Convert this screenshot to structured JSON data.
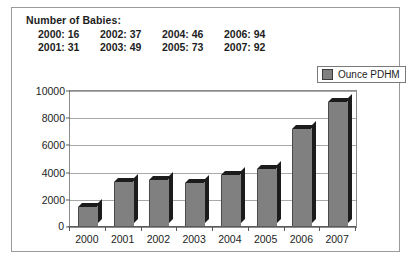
{
  "caption": {
    "title": "Number of Babies:",
    "rows": [
      [
        "2000: 16",
        "2002: 37",
        "2004: 46",
        "2006: 94"
      ],
      [
        "2001: 31",
        "2003: 49",
        "2005: 73",
        "2007: 92"
      ]
    ]
  },
  "legend": {
    "label": "Ounce PDHM",
    "swatch_color": "#808080"
  },
  "chart_data": {
    "type": "bar",
    "title": "",
    "xlabel": "",
    "ylabel": "",
    "categories": [
      "2000",
      "2001",
      "2002",
      "2003",
      "2004",
      "2005",
      "2006",
      "2007"
    ],
    "values": [
      1500,
      3300,
      3450,
      3200,
      3800,
      4300,
      7200,
      9200
    ],
    "series": [
      {
        "name": "Ounce PDHM",
        "values": [
          1500,
          3300,
          3450,
          3200,
          3800,
          4300,
          7200,
          9200
        ]
      }
    ],
    "ylim": [
      0,
      10000
    ],
    "yticks": [
      0,
      2000,
      4000,
      6000,
      8000,
      10000
    ],
    "ytick_labels": [
      "0",
      "2000",
      "4000",
      "6000",
      "8000",
      "10000"
    ],
    "grid": true,
    "legend_position": "top-right",
    "bar_color": "#808080"
  }
}
